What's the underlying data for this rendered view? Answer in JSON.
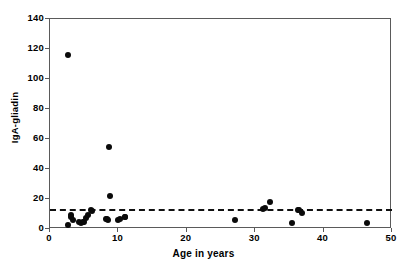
{
  "chart_data": {
    "type": "scatter",
    "title": "",
    "xlabel": "Age in years",
    "ylabel": "IgA-gliadin",
    "xlim": [
      0,
      50
    ],
    "ylim": [
      0,
      140
    ],
    "xticks": [
      0,
      10,
      20,
      30,
      40,
      50
    ],
    "yticks": [
      0,
      20,
      40,
      60,
      80,
      100,
      120,
      140
    ],
    "grid": false,
    "legend": false,
    "marker": "filled-circle",
    "marker_color": "#0a0a0a",
    "series": [
      {
        "name": "IgA-gliadin antibody level",
        "x": [
          2.6,
          2.7,
          3.0,
          3.1,
          3.3,
          4.2,
          4.5,
          4.8,
          5.0,
          5.3,
          5.6,
          6.0,
          6.1,
          8.2,
          8.4,
          8.5,
          8.6,
          8.7,
          9.9,
          10.2,
          10.9,
          11.0,
          27.0,
          31.2,
          31.4,
          32.1,
          35.4,
          36.2,
          36.4,
          36.9,
          46.4
        ],
        "y": [
          116.0,
          3.0,
          9.5,
          8.0,
          6.0,
          4.5,
          4.0,
          4.5,
          5.0,
          7.5,
          9.5,
          13.0,
          12.0,
          7.0,
          6.5,
          6.0,
          55.0,
          22.0,
          6.0,
          7.0,
          8.0,
          8.0,
          6.0,
          13.5,
          14.0,
          18.0,
          4.0,
          13.0,
          13.0,
          10.5,
          4.0
        ]
      }
    ],
    "reference_line": {
      "label": "cut-off",
      "orientation": "horizontal",
      "value": 13.5,
      "style": "dashed",
      "color": "#111111"
    }
  }
}
